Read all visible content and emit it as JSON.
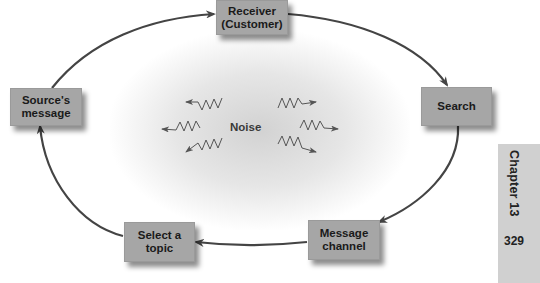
{
  "diagram": {
    "nodes": [
      {
        "id": "receiver",
        "label": "Receiver\n(Customer)"
      },
      {
        "id": "search",
        "label": "Search"
      },
      {
        "id": "message_channel",
        "label": "Message\nchannel"
      },
      {
        "id": "select_topic",
        "label": "Select a\ntopic"
      },
      {
        "id": "source_message",
        "label": "Source's\nmessage"
      }
    ],
    "edges": [
      {
        "from": "source_message",
        "to": "receiver"
      },
      {
        "from": "receiver",
        "to": "search"
      },
      {
        "from": "search",
        "to": "message_channel"
      },
      {
        "from": "message_channel",
        "to": "select_topic"
      },
      {
        "from": "select_topic",
        "to": "source_message"
      }
    ],
    "center_label": "Noise",
    "noise_icons": [
      "zigzag-arrow-left-up",
      "zigzag-arrow-left",
      "zigzag-arrow-left-down",
      "zigzag-arrow-right-up",
      "zigzag-arrow-right",
      "zigzag-arrow-right-down"
    ]
  },
  "page": {
    "chapter": "Chapter 13",
    "page_number": "329"
  },
  "colors": {
    "box_fill": "#a6a6a6",
    "arrow": "#444444",
    "side_tab": "#d0d0d0"
  }
}
